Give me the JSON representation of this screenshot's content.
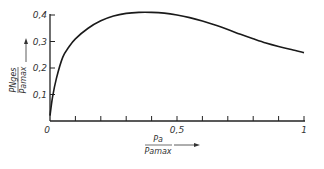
{
  "chart_data": {
    "type": "line",
    "title": "",
    "xlabel": "P_a / P_amax",
    "ylabel": "P_Nges / P_amax",
    "xlabel_parts": {
      "num": "Pa",
      "den": "Pamax"
    },
    "ylabel_parts": {
      "num": "PNges",
      "den": "Pamax"
    },
    "xlim": [
      0,
      1
    ],
    "ylim": [
      0,
      0.4
    ],
    "grid": false,
    "legend": null,
    "x_ticks": [
      0,
      0.1,
      0.2,
      0.3,
      0.4,
      0.5,
      0.6,
      0.7,
      0.8,
      0.9,
      1.0
    ],
    "x_tick_labels": [
      {
        "value": 0,
        "label": "0"
      },
      {
        "value": 0.5,
        "label": "0,5"
      },
      {
        "value": 1,
        "label": "1"
      }
    ],
    "y_ticks": [
      0.1,
      0.2,
      0.3,
      0.4
    ],
    "y_tick_labels": [
      {
        "value": 0.1,
        "label": "0,1"
      },
      {
        "value": 0.2,
        "label": "0,2"
      },
      {
        "value": 0.3,
        "label": "0,3"
      },
      {
        "value": 0.4,
        "label": "0,4"
      }
    ],
    "origin_label": "0",
    "series": [
      {
        "name": "P_Nges/P_amax",
        "x": [
          0,
          0.01,
          0.025,
          0.05,
          0.075,
          0.1,
          0.15,
          0.2,
          0.25,
          0.3,
          0.35,
          0.4,
          0.45,
          0.5,
          0.55,
          0.6,
          0.65,
          0.7,
          0.75,
          0.8,
          0.85,
          0.9,
          0.95,
          1.0
        ],
        "values": [
          0.02,
          0.09,
          0.16,
          0.24,
          0.28,
          0.31,
          0.35,
          0.378,
          0.396,
          0.406,
          0.41,
          0.41,
          0.407,
          0.4,
          0.39,
          0.377,
          0.362,
          0.345,
          0.327,
          0.31,
          0.294,
          0.281,
          0.27,
          0.258
        ]
      }
    ]
  }
}
